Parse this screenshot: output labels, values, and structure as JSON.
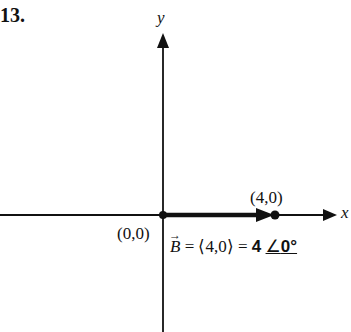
{
  "problem": {
    "number": "13."
  },
  "axes": {
    "x_label": "x",
    "y_label": "y",
    "origin_label": "(0,0)"
  },
  "vector": {
    "name": "B",
    "arrow": "→",
    "start_point": [
      0,
      0
    ],
    "end_point": [
      4,
      0
    ],
    "end_label": "(4,0)",
    "component_form": "= ⟨4,0⟩ =",
    "magnitude": "4",
    "angle_symbol": "∠",
    "angle": "0°"
  },
  "colors": {
    "ink": "#111111",
    "background": "#ffffff"
  }
}
